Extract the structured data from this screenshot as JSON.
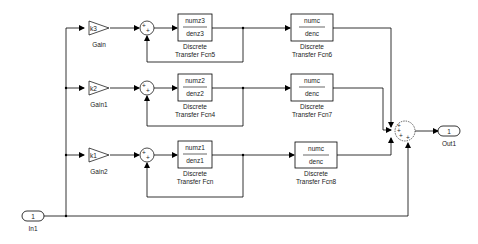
{
  "diagram": {
    "type": "simulink-block-diagram",
    "inport": {
      "label": "In1",
      "number": "1"
    },
    "outport": {
      "label": "Out1",
      "number": "1"
    },
    "branches": [
      {
        "gain": {
          "name": "Gain",
          "value": "k3"
        },
        "filter": {
          "num": "numz3",
          "den": "denz3",
          "name_line1": "Discrete",
          "name_line2": "Transfer Fcn5"
        },
        "output_filter": {
          "num": "numc",
          "den": "denc",
          "name_line1": "Discrete",
          "name_line2": "Transfer Fcn6"
        },
        "sum_signs": [
          "+",
          "+"
        ]
      },
      {
        "gain": {
          "name": "Gain1",
          "value": "k2"
        },
        "filter": {
          "num": "numz2",
          "den": "denz2",
          "name_line1": "Discrete",
          "name_line2": "Transfer Fcn4"
        },
        "output_filter": {
          "num": "numc",
          "den": "denc",
          "name_line1": "Discrete",
          "name_line2": "Transfer Fcn7"
        },
        "sum_signs": [
          "+",
          "+"
        ]
      },
      {
        "gain": {
          "name": "Gain2",
          "value": "k1"
        },
        "filter": {
          "num": "numz1",
          "den": "denz1",
          "name_line1": "Discrete",
          "name_line2": "Transfer Fcn"
        },
        "output_filter": {
          "num": "numc",
          "den": "denc",
          "name_line1": "Discrete",
          "name_line2": "Transfer Fcn8"
        },
        "sum_signs": [
          "+",
          "+"
        ]
      }
    ],
    "output_sum": {
      "signs": [
        "+",
        "+",
        "+",
        "+"
      ]
    },
    "colors": {
      "line": "#000000",
      "background": "#ffffff"
    }
  }
}
